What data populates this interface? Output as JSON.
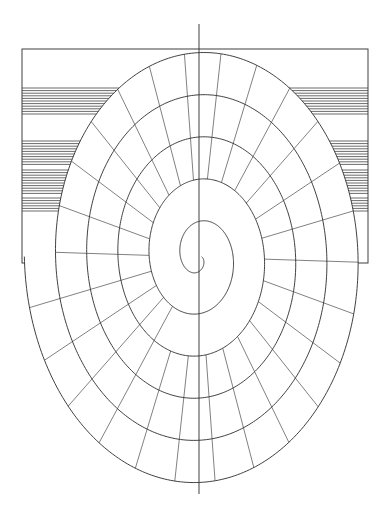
{
  "canvas": {
    "width": 389,
    "height": 515,
    "background": "#ffffff",
    "title": "Spiral geometric line drawing over hatched rectangle"
  },
  "style": {
    "stroke": "#2b2b2b",
    "stroke_light": "#4a4a4a",
    "hatch_stroke": "#3a3a3a",
    "outline_width": 0.9,
    "hatch_width": 0.75,
    "tick_width": 0.7,
    "fill": "#ffffff"
  },
  "rectangle": {
    "name": "hatched-rectangle",
    "x": 22,
    "y": 49,
    "width": 346,
    "height": 214,
    "stroke": "#2b2b2b",
    "fill": "none",
    "hatch": {
      "orientation": "horizontal",
      "bands": [
        {
          "y_start": 88,
          "y_end": 116,
          "spacing": 2.6
        },
        {
          "y_start": 141,
          "y_end": 166,
          "spacing": 2.6
        },
        {
          "y_start": 170,
          "y_end": 194,
          "spacing": 2.6
        },
        {
          "y_start": 198,
          "y_end": 213,
          "spacing": 2.6
        }
      ]
    }
  },
  "spiral": {
    "name": "concentric-oval-spiral",
    "center_x": 199,
    "center_y": 257,
    "turns": 5.5,
    "start_angle_deg": 90,
    "direction": "clockwise",
    "aspect_ratio_x": 0.74,
    "r_start": 4,
    "r_end": 236,
    "band_count": 11,
    "extent": {
      "top": 24,
      "bottom": 494,
      "left": 63,
      "right": 296
    },
    "axis_line": {
      "name": "vertical-center-axis",
      "x": 199,
      "y_top": 24,
      "y_bottom": 494
    },
    "ticks": {
      "name": "radial-segment-ticks",
      "count_per_turn": 26,
      "description": "short radial crossbars between adjacent spiral arms"
    }
  },
  "legend": {
    "items": []
  }
}
